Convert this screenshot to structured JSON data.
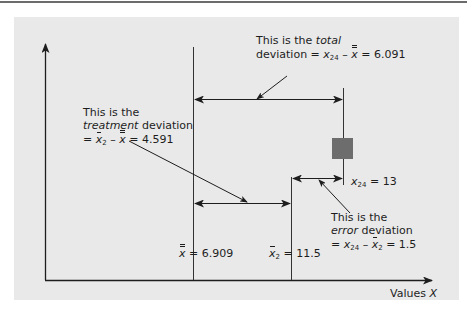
{
  "diagram": {
    "axes": {
      "x_label": "Values",
      "x_var": "X"
    },
    "reference_lines": {
      "grand_mean": {
        "symbol": "x",
        "value": "6.909",
        "label_eq": "= 6.909"
      },
      "group_mean": {
        "symbol": "x",
        "subscript": "2",
        "value": "11.5",
        "label_eq": "= 11.5"
      },
      "observation": {
        "symbol": "x",
        "subscript": "24",
        "value": "13",
        "label_eq": "= 13"
      }
    },
    "total": {
      "line1_prefix": "This is the ",
      "line1_em": "total",
      "line2_prefix": "deviation = ",
      "x": "x",
      "sub": "24",
      "minus": " – ",
      "xbar": "x",
      "result": " = 6.091"
    },
    "treatment": {
      "line1": "This is the",
      "line2_em": "treatment",
      "line2_suffix": " deviation",
      "line3_prefix": "= ",
      "xbar": "x",
      "sub": "2",
      "minus": " – ",
      "xbarbar": "x",
      "result": " = 4.591"
    },
    "error": {
      "line1": "This is the",
      "line2_em": "error",
      "line2_suffix": " deviation",
      "line3_prefix": "= ",
      "x": "x",
      "sub": "24",
      "minus": " – ",
      "xbar": "x",
      "sub2": "2",
      "result": " = 1.5"
    },
    "colors": {
      "panel": "#e9e9e9",
      "line": "#1d1d1d",
      "marker": "#6d6d6d"
    }
  }
}
